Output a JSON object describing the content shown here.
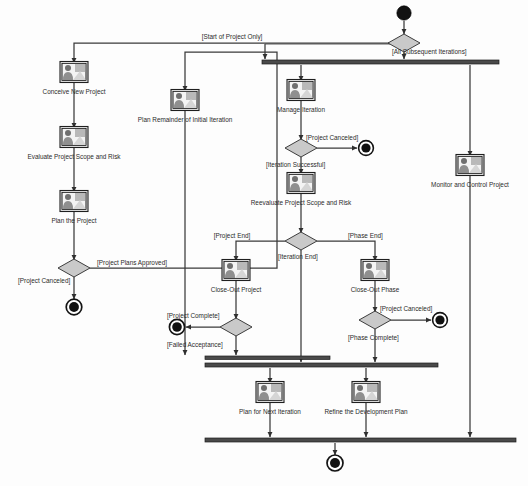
{
  "diagram": {
    "type": "uml-activity-diagram",
    "colors": {
      "line": "#3a3a3a",
      "bar": "#4a4a4a",
      "decision_fill": "#c9c9c9",
      "activity_fill": "#e2e2e2",
      "node_fill": "#111111",
      "background": "#ffffff",
      "text": "#2b2b2b"
    },
    "activities": [
      {
        "id": "conceive",
        "label": "Conceive New Project",
        "x": 74,
        "y": 72,
        "label_x": 74,
        "label_y": 94
      },
      {
        "id": "evaluate",
        "label": "Evaluate Project Scope and Risk",
        "x": 104,
        "y": 137,
        "label_x": 74,
        "label_y": 159
      },
      {
        "id": "planproj",
        "label": "Plan the Project",
        "x": 74,
        "y": 201,
        "label_x": 74,
        "label_y": 223
      },
      {
        "id": "planrem",
        "label": "Plan Remainder of Initial Iteration",
        "x": 185,
        "y": 100,
        "label_x": 185,
        "label_y": 122
      },
      {
        "id": "manage",
        "label": "Manage Iteration",
        "x": 301,
        "y": 90,
        "label_x": 301,
        "label_y": 112
      },
      {
        "id": "reevaluate",
        "label": "Reevaluate Project Scope and Risk",
        "x": 301,
        "y": 183,
        "label_x": 301,
        "label_y": 205
      },
      {
        "id": "closeproj",
        "label": "Close-Out Project",
        "x": 236,
        "y": 270,
        "label_x": 236,
        "label_y": 292
      },
      {
        "id": "closephase",
        "label": "Close-Out Phase",
        "x": 375,
        "y": 270,
        "label_x": 375,
        "label_y": 292
      },
      {
        "id": "monitor",
        "label": "Monitor and Control Project",
        "x": 470,
        "y": 165,
        "label_x": 470,
        "label_y": 187
      },
      {
        "id": "plannext",
        "label": "Plan for Next Iteration",
        "x": 270,
        "y": 392,
        "label_x": 270,
        "label_y": 414
      },
      {
        "id": "refine",
        "label": "Refine the Development Plan",
        "x": 366,
        "y": 392,
        "label_x": 366,
        "label_y": 414
      }
    ],
    "guards": [
      {
        "id": "start_only",
        "text": "[Start of Project Only]",
        "x": 232,
        "y": 39,
        "anchor": "middle"
      },
      {
        "id": "all_subsequent",
        "text": "[All Subsequent Iterations]",
        "x": 392,
        "y": 54,
        "anchor": "start"
      },
      {
        "id": "project_canceled_1",
        "text": "[Project Canceled]",
        "x": 306,
        "y": 140,
        "anchor": "start"
      },
      {
        "id": "iteration_success",
        "text": "[Iteration Successful]",
        "x": 266,
        "y": 167,
        "anchor": "start"
      },
      {
        "id": "project_end",
        "text": "[Project End]",
        "x": 232,
        "y": 238,
        "anchor": "middle"
      },
      {
        "id": "phase_end",
        "text": "[Phase End]",
        "x": 348,
        "y": 238,
        "anchor": "start"
      },
      {
        "id": "iteration_end",
        "text": "[Iteration End]",
        "x": 278,
        "y": 259,
        "anchor": "start"
      },
      {
        "id": "plans_approved",
        "text": "[Project Plans Approved]",
        "x": 97,
        "y": 265,
        "anchor": "start"
      },
      {
        "id": "project_canceled_2",
        "text": "[Project Canceled]",
        "x": 18,
        "y": 283,
        "anchor": "start"
      },
      {
        "id": "project_complete",
        "text": "[Project Complete]",
        "x": 167,
        "y": 318,
        "anchor": "start"
      },
      {
        "id": "failed_accept",
        "text": "[Failed Acceptance]",
        "x": 167,
        "y": 347,
        "anchor": "start"
      },
      {
        "id": "project_canceled_3",
        "text": "[Project Canceled]",
        "x": 380,
        "y": 311,
        "anchor": "start"
      },
      {
        "id": "phase_complete",
        "text": "[Phase Complete]",
        "x": 348,
        "y": 340,
        "anchor": "start"
      }
    ],
    "decisions": [
      {
        "id": "entry_decision",
        "x": 404,
        "y": 43
      },
      {
        "id": "cancel_decision",
        "x": 301,
        "y": 148
      },
      {
        "id": "iteration_decision",
        "x": 301,
        "y": 241
      },
      {
        "id": "acceptance_decision",
        "x": 236,
        "y": 327
      },
      {
        "id": "phase_decision",
        "x": 375,
        "y": 320
      },
      {
        "id": "approval_decision",
        "x": 74,
        "y": 268
      }
    ],
    "initial_nodes": [
      {
        "id": "start",
        "x": 404,
        "y": 13
      }
    ],
    "final_nodes": [
      {
        "id": "end_cancel_iteration",
        "x": 366,
        "y": 148
      },
      {
        "id": "end_project_canceled",
        "x": 74,
        "y": 307
      },
      {
        "id": "end_project_complete",
        "x": 177,
        "y": 327
      },
      {
        "id": "end_phase_canceled",
        "x": 440,
        "y": 320
      },
      {
        "id": "end_final",
        "x": 335,
        "y": 463
      }
    ],
    "bars": [
      {
        "id": "fork-bar-main",
        "x1": 262,
        "x2": 499,
        "y": 62
      },
      {
        "id": "join-bar-accept",
        "x1": 205,
        "x2": 330,
        "y": 358
      },
      {
        "id": "join-bar-mid",
        "x1": 205,
        "x2": 438,
        "y": 365
      },
      {
        "id": "join-bar-final",
        "x1": 205,
        "x2": 516,
        "y": 440
      }
    ]
  }
}
